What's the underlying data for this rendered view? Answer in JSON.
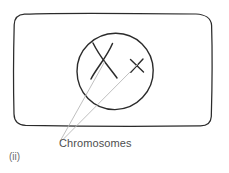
{
  "figure": {
    "caption": "(ii)",
    "background_color": "#ffffff",
    "ink_color": "#2b2b2b",
    "leader_color": "#b5b5b5",
    "text_color": "#4e4e4e"
  },
  "annotations": {
    "chromosomes_label": "Chromosomes"
  },
  "parts": {
    "cell_membrane": "cell-outline-rounded-rectangle",
    "nucleus": "nucleus-circle",
    "chromosome_large": "chromosome-x-large",
    "chromosome_small": "chromosome-x-small",
    "leader_line_1": "leader-line-to-large-chromosome",
    "leader_line_2": "leader-line-to-small-chromosome"
  },
  "geometry": {
    "cell": {
      "x": 14,
      "y": 14,
      "width": 198,
      "height": 112,
      "corner_radius": 10
    },
    "nucleus": {
      "cx": 115,
      "cy": 71,
      "r": 38
    },
    "chromosome_large": {
      "cx": 104,
      "cy": 60,
      "size": 34
    },
    "chromosome_small": {
      "cx": 137,
      "cy": 66,
      "size": 16
    },
    "leader_convergence": {
      "x": 60,
      "y": 140
    }
  }
}
